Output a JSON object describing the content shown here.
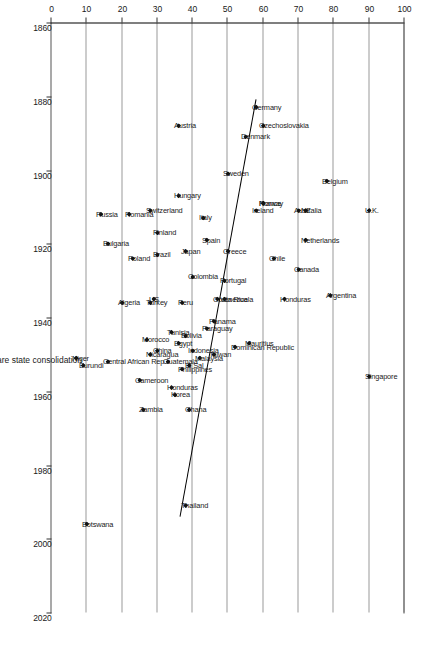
{
  "chart_data": {
    "type": "scatter",
    "title": "",
    "xlabel": "Year of welfare state consolidation",
    "ylabel": "% of non-agricultural workforce",
    "xlim": [
      1860,
      2020
    ],
    "ylim": [
      0,
      100
    ],
    "xticks": [
      1860,
      1880,
      1900,
      1920,
      1940,
      1960,
      1980,
      2000,
      2020
    ],
    "yticks": [
      0,
      10,
      20,
      30,
      40,
      50,
      60,
      70,
      80,
      90,
      100
    ],
    "grid": "y-gridlines only (horizontal bands at each 10%)",
    "legend": "none",
    "orientation": "image rotated 90 degrees clockwise; year axis on right, percent axis along bottom",
    "trendline": {
      "x1": 1881,
      "y1": 58,
      "x2": 1994,
      "y2": 36.5
    },
    "points": [
      {
        "label": "Germany",
        "x": 1883,
        "y": 58
      },
      {
        "label": "Czechoslovakia",
        "x": 1888,
        "y": 60
      },
      {
        "label": "Denmark",
        "x": 1891,
        "y": 55
      },
      {
        "label": "Sweden",
        "x": 1901,
        "y": 50
      },
      {
        "label": "Belgium",
        "x": 1903,
        "y": 78
      },
      {
        "label": "Austria",
        "x": 1888,
        "y": 36
      },
      {
        "label": "Hungary",
        "x": 1907,
        "y": 36
      },
      {
        "label": "Norway",
        "x": 1909,
        "y": 60
      },
      {
        "label": "France",
        "x": 1909,
        "y": 60
      },
      {
        "label": "U.K.",
        "x": 1911,
        "y": 90
      },
      {
        "label": "Australia",
        "x": 1911,
        "y": 70
      },
      {
        "label": "NZ",
        "x": 1911,
        "y": 72
      },
      {
        "label": "Ireland",
        "x": 1911,
        "y": 58
      },
      {
        "label": "Switzerland",
        "x": 1911,
        "y": 28
      },
      {
        "label": "Romania",
        "x": 1912,
        "y": 22
      },
      {
        "label": "Russia",
        "x": 1912,
        "y": 14
      },
      {
        "label": "Italy",
        "x": 1913,
        "y": 43
      },
      {
        "label": "Spain",
        "x": 1919,
        "y": 44
      },
      {
        "label": "Finland",
        "x": 1917,
        "y": 30
      },
      {
        "label": "Netherlands",
        "x": 1919,
        "y": 72
      },
      {
        "label": "Greece",
        "x": 1922,
        "y": 50
      },
      {
        "label": "Bulgaria",
        "x": 1920,
        "y": 16
      },
      {
        "label": "Japan",
        "x": 1922,
        "y": 38
      },
      {
        "label": "Brazil",
        "x": 1923,
        "y": 30
      },
      {
        "label": "Poland",
        "x": 1924,
        "y": 23
      },
      {
        "label": "Chile",
        "x": 1924,
        "y": 63
      },
      {
        "label": "Canada",
        "x": 1927,
        "y": 70
      },
      {
        "label": "Colombia",
        "x": 1929,
        "y": 40
      },
      {
        "label": "Portugal",
        "x": 1930,
        "y": 49
      },
      {
        "label": "Argentina",
        "x": 1934,
        "y": 79
      },
      {
        "label": "Honduras",
        "x": 1935,
        "y": 66
      },
      {
        "label": "Venezuela",
        "x": 1935,
        "y": 49
      },
      {
        "label": "Costa Rica",
        "x": 1935,
        "y": 47
      },
      {
        "label": "Peru",
        "x": 1936,
        "y": 37
      },
      {
        "label": "Algeria",
        "x": 1936,
        "y": 20
      },
      {
        "label": "US",
        "x": 1935,
        "y": 29
      },
      {
        "label": "Turkey",
        "x": 1936,
        "y": 28
      },
      {
        "label": "Panama",
        "x": 1941,
        "y": 46
      },
      {
        "label": "Paraguay",
        "x": 1943,
        "y": 44
      },
      {
        "label": "Tunisia",
        "x": 1944,
        "y": 34
      },
      {
        "label": "Bolivia",
        "x": 1945,
        "y": 38
      },
      {
        "label": "Morocco",
        "x": 1946,
        "y": 27
      },
      {
        "label": "Egypt",
        "x": 1947,
        "y": 36
      },
      {
        "label": "Mauritius",
        "x": 1947,
        "y": 56
      },
      {
        "label": "China",
        "x": 1949,
        "y": 30
      },
      {
        "label": "Indonesia",
        "x": 1949,
        "y": 40
      },
      {
        "label": "Taiwan",
        "x": 1950,
        "y": 46
      },
      {
        "label": "Nicaragua",
        "x": 1950,
        "y": 28
      },
      {
        "label": "Niger",
        "x": 1951,
        "y": 7
      },
      {
        "label": "Burundi",
        "x": 1953,
        "y": 9
      },
      {
        "label": "Dominican Republic",
        "x": 1948,
        "y": 52
      },
      {
        "label": "Malaysia",
        "x": 1951,
        "y": 42
      },
      {
        "label": "Guatemala",
        "x": 1952,
        "y": 33
      },
      {
        "label": "El Sal",
        "x": 1953,
        "y": 39
      },
      {
        "label": "Central African Rep.",
        "x": 1952,
        "y": 16
      },
      {
        "label": "Cameroon",
        "x": 1957,
        "y": 25
      },
      {
        "label": "Philippines",
        "x": 1954,
        "y": 37
      },
      {
        "label": "Honduras",
        "x": 1959,
        "y": 34
      },
      {
        "label": "Korea",
        "x": 1961,
        "y": 35
      },
      {
        "label": "Ghana",
        "x": 1965,
        "y": 39
      },
      {
        "label": "Zambia",
        "x": 1965,
        "y": 26
      },
      {
        "label": "Thailand",
        "x": 1991,
        "y": 38
      },
      {
        "label": "Botswana",
        "x": 1996,
        "y": 10
      },
      {
        "label": "Singapore",
        "x": 1956,
        "y": 90
      }
    ]
  },
  "axes": {
    "y_axis_title": "% of non-agricultural workforce",
    "x_axis_title": "Year of welfare state consolidation",
    "y_tick_labels": [
      "100",
      "90",
      "80",
      "70",
      "60",
      "50",
      "40",
      "30",
      "20",
      "10",
      "0"
    ],
    "x_tick_labels": [
      "1860",
      "1880",
      "1900",
      "1920",
      "1940",
      "1960",
      "1980",
      "2000",
      "2020"
    ]
  },
  "colors": {
    "marker": "#111111",
    "gridline": "#9a9a9a",
    "axis": "#000000",
    "text": "#1a1a1a",
    "trendline": "#000000",
    "background": "#ffffff"
  }
}
